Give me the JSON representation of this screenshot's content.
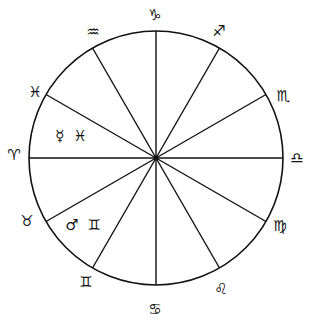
{
  "chart": {
    "center": [
      156,
      158
    ],
    "radius": 127,
    "stroke_color": "#111111",
    "spoke_angles_deg": [
      0,
      30,
      60,
      90,
      120,
      150,
      180,
      210,
      240,
      270,
      300,
      330
    ]
  },
  "signs": [
    {
      "id": "capricorn",
      "glyph": "♑",
      "x": 155,
      "y": 15
    },
    {
      "id": "sagittarius",
      "glyph": "♐",
      "x": 219,
      "y": 31
    },
    {
      "id": "scorpio",
      "glyph": "♏",
      "x": 283,
      "y": 96
    },
    {
      "id": "libra",
      "glyph": "♎",
      "x": 297,
      "y": 158
    },
    {
      "id": "virgo",
      "glyph": "♍",
      "x": 280,
      "y": 226
    },
    {
      "id": "leo",
      "glyph": "♌",
      "x": 221,
      "y": 289
    },
    {
      "id": "cancer",
      "glyph": "♋",
      "x": 155,
      "y": 309
    },
    {
      "id": "gemini",
      "glyph": "♊",
      "x": 86,
      "y": 282
    },
    {
      "id": "taurus",
      "glyph": "♉",
      "x": 27,
      "y": 221
    },
    {
      "id": "aries",
      "glyph": "♈",
      "x": 14,
      "y": 155
    },
    {
      "id": "pisces",
      "glyph": "♓",
      "x": 35,
      "y": 92
    },
    {
      "id": "aquarius",
      "glyph": "♒",
      "x": 93,
      "y": 32
    }
  ],
  "planets": [
    {
      "id": "mercury-in-pisces",
      "label": "☿ ♓",
      "x": 72,
      "y": 136
    },
    {
      "id": "mars-in-gemini",
      "label": "♂ ♊",
      "x": 84,
      "y": 225
    }
  ]
}
